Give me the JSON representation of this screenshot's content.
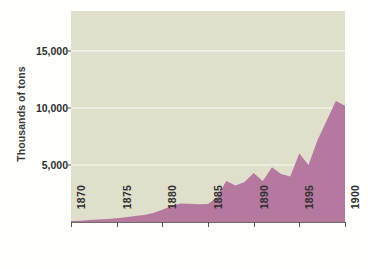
{
  "chart_data": {
    "type": "area",
    "title": "",
    "subtitle": "",
    "xlabel": "",
    "ylabel": "Thousands of tons",
    "xlim": [
      1870,
      1900
    ],
    "ylim": [
      0,
      18500
    ],
    "grid": true,
    "gridlines_y": [
      5000,
      10000,
      15000
    ],
    "legend": "none",
    "x_tick_labels": [
      "1870",
      "1875",
      "1880",
      "1885",
      "1890",
      "1895",
      "1900"
    ],
    "x_tick_values": [
      1870,
      1875,
      1880,
      1885,
      1890,
      1895,
      1900
    ],
    "y_tick_labels": [
      "5,000",
      "10,000",
      "15,000"
    ],
    "y_tick_values": [
      5000,
      10000,
      15000
    ],
    "colors": {
      "area_fill": "#b5799f",
      "plot_background": "#dfdfcc",
      "gridline": "#f2f2ea",
      "axis": "#55554e",
      "text": "#2f2f2f",
      "page_background": "#fefefd"
    },
    "x": [
      1870,
      1871,
      1872,
      1873,
      1874,
      1875,
      1876,
      1877,
      1878,
      1879,
      1880,
      1881,
      1882,
      1883,
      1884,
      1885,
      1886,
      1887,
      1888,
      1889,
      1890,
      1891,
      1892,
      1893,
      1894,
      1895,
      1896,
      1897,
      1898,
      1899,
      1900
    ],
    "series": [
      {
        "name": "Production",
        "values": [
          80,
          120,
          180,
          230,
          260,
          320,
          420,
          520,
          620,
          780,
          1080,
          1400,
          1620,
          1600,
          1560,
          1580,
          2200,
          3600,
          3200,
          3500,
          4300,
          3600,
          4800,
          4200,
          4000,
          6000,
          5000,
          7200,
          8900,
          10600,
          10200
        ]
      }
    ]
  }
}
